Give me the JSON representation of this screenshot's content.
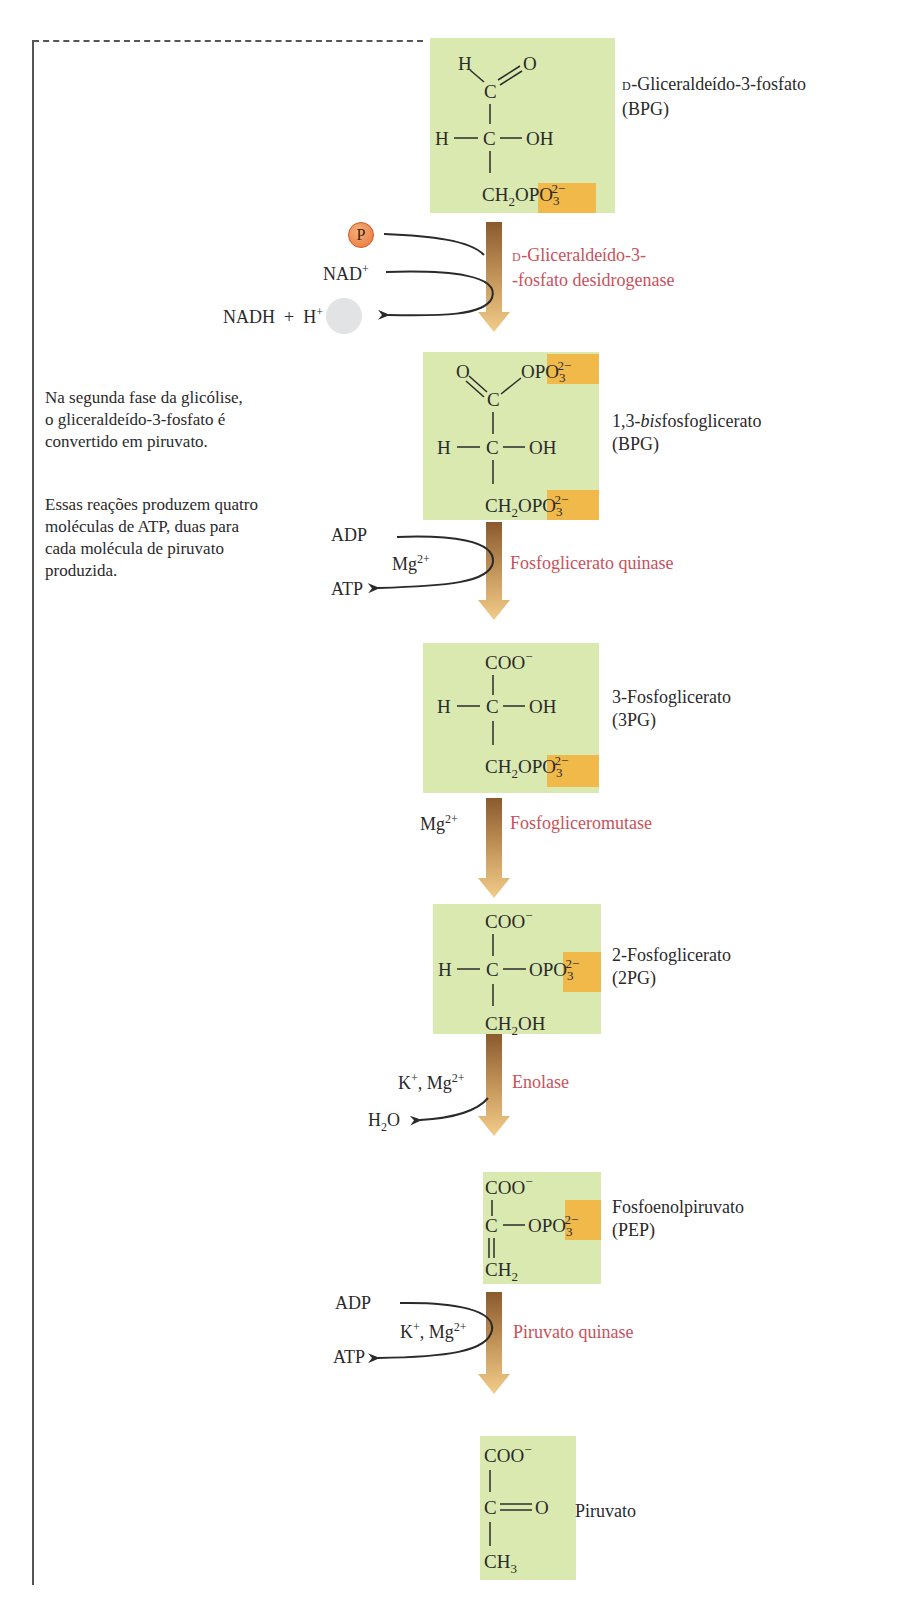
{
  "description": {
    "paragraph1": [
      "Na segunda fase da glicólise,",
      "o  gliceraldeído-3-fosfato é",
      "convertido em piruvato."
    ],
    "paragraph2": [
      "Essas reações produzem quatro",
      "moléculas de ATP, duas para",
      "cada molécula de piruvato",
      "produzida."
    ]
  },
  "molecules": [
    {
      "prefix": "D",
      "name": "-Gliceraldeído-3-fosfato",
      "abbr": "(BPG)"
    },
    {
      "name": "1,3-",
      "name_italic": "bis",
      "name_rest": "fosfoglicerato",
      "abbr": "(BPG)"
    },
    {
      "name": "3-Fosfoglicerato",
      "abbr": "(3PG)"
    },
    {
      "name": "2-Fosfoglicerato",
      "abbr": "(2PG)"
    },
    {
      "name": "Fosfoenolpiruvato",
      "abbr": "(PEP)"
    },
    {
      "name": "Piruvato"
    }
  ],
  "steps": [
    {
      "enzyme_prefix": "D",
      "enzyme_line1": "-Gliceraldeído-3-",
      "enzyme_line2": "-fosfato desidrogenase",
      "phosphate": "P",
      "input": "NAD",
      "input_sup": "+",
      "output1": "NADH",
      "plus": "+",
      "output2": "H",
      "output2_sup": "+"
    },
    {
      "enzyme": "Fosfoglicerato quinase",
      "input": "ADP",
      "cofactor": "Mg",
      "cofactor_sup": "2+",
      "output": "ATP"
    },
    {
      "enzyme": "Fosfogliceromutase",
      "cofactor": "Mg",
      "cofactor_sup": "2+"
    },
    {
      "enzyme": "Enolase",
      "cofactor_a": "K",
      "cofactor_a_sup": "+",
      "sep": ", ",
      "cofactor_b": "Mg",
      "cofactor_b_sup": "2+",
      "output": "H",
      "output_sub": "2",
      "output_rest": "O"
    },
    {
      "enzyme": "Piruvato quinase",
      "input": "ADP",
      "cofactor_a": "K",
      "cofactor_a_sup": "+",
      "sep": ", ",
      "cofactor_b": "Mg",
      "cofactor_b_sup": "2+",
      "output": "ATP"
    }
  ],
  "structures": {
    "H": "H",
    "C": "C",
    "O": "O",
    "OH": "OH",
    "COO": "COO",
    "minus": "−",
    "CH": "CH",
    "OPO": "OPO",
    "charge": "2−",
    "three": "3",
    "two": "2"
  },
  "colors": {
    "molecule_box": "#d9e9b0",
    "phosphate_highlight": "#f0b94a",
    "enzyme_text": "#c9515a",
    "arrow_top": "#8a5a2e",
    "arrow_bottom": "#f2cc8a"
  }
}
